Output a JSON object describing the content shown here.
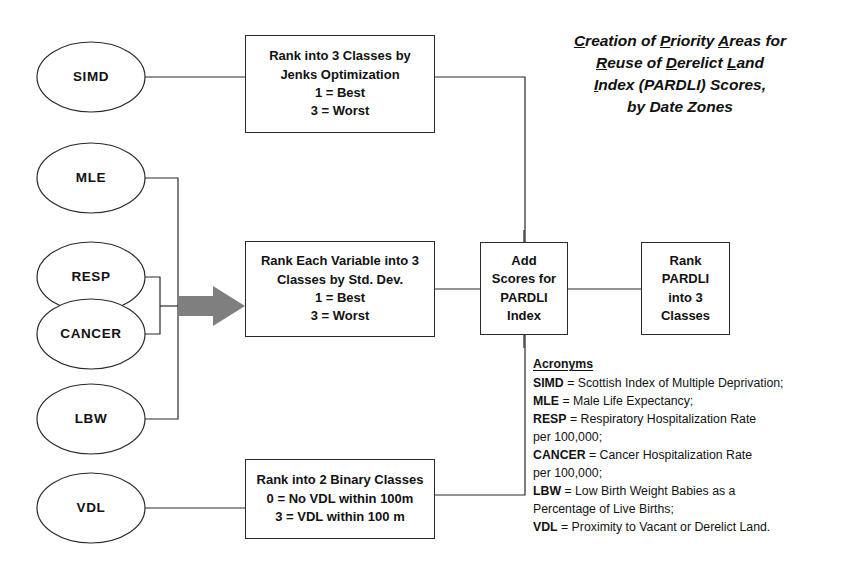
{
  "title": {
    "lines": [
      [
        {
          "u": "C",
          "rest": "reation of "
        },
        {
          "u": "P",
          "rest": "riority "
        },
        {
          "u": "A",
          "rest": "reas for"
        }
      ],
      [
        {
          "u": "R",
          "rest": "euse of "
        },
        {
          "u": "D",
          "rest": "erelict "
        },
        {
          "u": "L",
          "rest": "and"
        }
      ],
      [
        {
          "u": "I",
          "rest": "ndex (PARDLI) Scores,"
        }
      ],
      [
        {
          "u": "",
          "rest": "by Date Zones"
        }
      ]
    ]
  },
  "inputs": [
    {
      "id": "simd",
      "label": "SIMD"
    },
    {
      "id": "mle",
      "label": "MLE"
    },
    {
      "id": "resp",
      "label": "RESP"
    },
    {
      "id": "cancer",
      "label": "CANCER"
    },
    {
      "id": "lbw",
      "label": "LBW"
    },
    {
      "id": "vdl",
      "label": "VDL"
    }
  ],
  "boxes": {
    "jenks": {
      "id": "rank-jenks",
      "lines": [
        "Rank into 3 Classes by",
        "Jenks Optimization",
        "1 = Best",
        "3 = Worst"
      ]
    },
    "stddev": {
      "id": "rank-stddev",
      "lines": [
        "Rank Each Variable into 3",
        "Classes by Std. Dev.",
        "1 = Best",
        "3 = Worst"
      ]
    },
    "binary": {
      "id": "rank-binary",
      "lines": [
        "Rank into 2 Binary Classes",
        "0 = No VDL within 100m",
        "3 = VDL within 100 m"
      ]
    },
    "add": {
      "id": "add-scores",
      "lines": [
        "Add",
        "Scores for",
        "PARDLI",
        "Index"
      ]
    },
    "rank": {
      "id": "rank-pardli",
      "lines": [
        "Rank",
        "PARDLI",
        "into 3",
        "Classes"
      ]
    }
  },
  "legend": {
    "heading": "Acronyms",
    "entries": [
      {
        "abbr": "SIMD",
        "text": " = Scottish Index of Multiple Deprivation;",
        "cont": ""
      },
      {
        "abbr": "MLE",
        "text": " = Male Life Expectancy;",
        "cont": ""
      },
      {
        "abbr": "RESP",
        "text": " = Respiratory Hospitalization Rate",
        "cont": "per 100,000;"
      },
      {
        "abbr": "CANCER",
        "text": " = Cancer Hospitalization Rate",
        "cont": "per 100,000;"
      },
      {
        "abbr": "LBW",
        "text": " = Low Birth Weight Babies as a",
        "cont": "Percentage of Live Births;"
      },
      {
        "abbr": "VDL",
        "text": " = Proximity to Vacant or Derelict Land.",
        "cont": ""
      }
    ]
  },
  "colors": {
    "stroke": "#2a2a2a",
    "arrow_fill": "#7f7f7f",
    "text": "#121212",
    "background": "#ffffff"
  }
}
